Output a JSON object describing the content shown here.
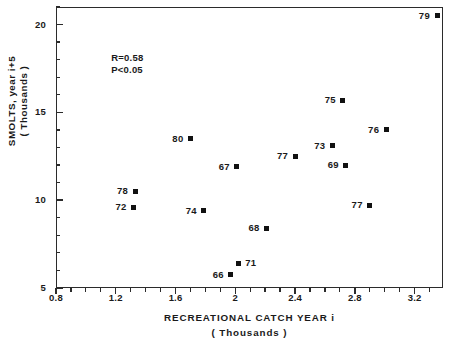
{
  "chart_data": {
    "type": "scatter",
    "title": "",
    "xlabel": "RECREATIONAL  CATCH  YEAR i",
    "xlabel_sub": "( Thousands )",
    "ylabel": "SMOLTS, year i+5",
    "ylabel_sub": "( Thousands )",
    "xlim": [
      0.8,
      3.39
    ],
    "ylim": [
      5,
      21.0
    ],
    "grid": false,
    "legend": null,
    "xticks": [
      "0.8",
      "1.2",
      "1.6",
      "2",
      "2.4",
      "2.8",
      "3.2"
    ],
    "xtick_values": [
      0.8,
      1.2,
      1.6,
      2.0,
      2.4,
      2.8,
      3.2
    ],
    "xminor_step": 0.1,
    "yticks": [
      "5",
      "10",
      "15",
      "20"
    ],
    "ytick_values": [
      5,
      10,
      15,
      20
    ],
    "yminor_step": 1,
    "annotations": [
      {
        "name": "correlation",
        "text": "R=0.58",
        "x": 1.17,
        "y": 18.4
      },
      {
        "name": "significance",
        "text": "P<0.05",
        "x": 1.17,
        "y": 17.7
      }
    ],
    "points": [
      {
        "label": "79",
        "x": 3.35,
        "y": 20.5,
        "label_side": "left"
      },
      {
        "label": "75",
        "x": 2.72,
        "y": 15.7,
        "label_side": "left"
      },
      {
        "label": "76",
        "x": 3.01,
        "y": 14.0,
        "label_side": "left"
      },
      {
        "label": "80",
        "x": 1.7,
        "y": 13.5,
        "label_side": "left"
      },
      {
        "label": "73",
        "x": 2.65,
        "y": 13.1,
        "label_side": "left"
      },
      {
        "label": "77",
        "x": 2.4,
        "y": 12.5,
        "label_side": "left"
      },
      {
        "label": "69",
        "x": 2.74,
        "y": 12.0,
        "label_side": "left"
      },
      {
        "label": "67",
        "x": 2.01,
        "y": 11.9,
        "label_side": "left"
      },
      {
        "label": "78",
        "x": 1.33,
        "y": 10.5,
        "label_side": "left"
      },
      {
        "label": "77",
        "x": 2.9,
        "y": 9.7,
        "label_side": "left"
      },
      {
        "label": "72",
        "x": 1.32,
        "y": 9.6,
        "label_side": "left"
      },
      {
        "label": "74",
        "x": 1.79,
        "y": 9.4,
        "label_side": "left"
      },
      {
        "label": "68",
        "x": 2.21,
        "y": 8.4,
        "label_side": "left"
      },
      {
        "label": "71",
        "x": 2.02,
        "y": 6.4,
        "label_side": "right"
      },
      {
        "label": "66",
        "x": 1.97,
        "y": 5.75,
        "label_side": "left"
      }
    ]
  },
  "caption": {
    "text": ""
  }
}
